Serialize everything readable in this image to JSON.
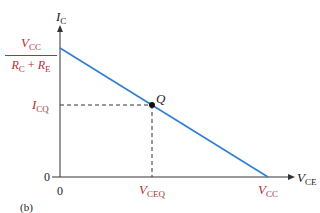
{
  "diagram": {
    "panel_label": "(b)",
    "y_axis": {
      "symbol": "I",
      "subscript": "C"
    },
    "x_axis": {
      "symbol": "V",
      "subscript": "CE"
    },
    "y_intercept": {
      "num_symbol": "V",
      "num_sub": "CC",
      "den_text_a": "R",
      "den_sub_a": "C",
      "plus": " + ",
      "den_text_b": "R",
      "den_sub_b": "E"
    },
    "x_intercept": {
      "symbol": "V",
      "subscript": "CC"
    },
    "q_point": {
      "label": "Q"
    },
    "icq": {
      "symbol": "I",
      "subscript": "CQ"
    },
    "vceq": {
      "symbol": "V",
      "subscript": "CEQ"
    },
    "origin_x": "0",
    "origin_y": "0",
    "colors": {
      "load_line": "#2f7fd0",
      "label_red": "#b0303a",
      "axis": "#333333"
    }
  }
}
